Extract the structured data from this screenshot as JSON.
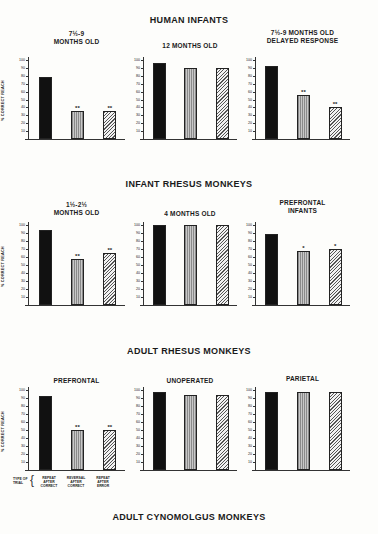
{
  "sections": [
    {
      "title": "HUMAN INFANTS"
    },
    {
      "title": "INFANT RHESUS MONKEYS"
    },
    {
      "title": "ADULT RHESUS MONKEYS"
    },
    {
      "title": "ADULT CYNOMOLGUS MONKEYS"
    }
  ],
  "y_axis_label": "% CORRECT REACH",
  "y_ticks": [
    "10",
    "20",
    "30",
    "40",
    "50",
    "60",
    "70",
    "80",
    "90",
    "100"
  ],
  "trial_type_label": "TYPE OF TRIAL",
  "trial_types": [
    "REPEAT AFTER CORRECT",
    "REVERSAL AFTER CORRECT",
    "REPEAT AFTER ERROR"
  ],
  "chart_data": [
    {
      "type": "bar",
      "section": "HUMAN INFANTS",
      "title": "7½-9 MONTHS OLD",
      "ylabel": "% CORRECT REACH",
      "ylim": [
        0,
        100
      ],
      "categories": [
        "Repeat after correct",
        "Reversal after correct",
        "Repeat after error"
      ],
      "values": [
        79,
        35,
        36
      ],
      "significance": [
        "",
        "**",
        "**"
      ]
    },
    {
      "type": "bar",
      "section": "HUMAN INFANTS",
      "title": "12 MONTHS OLD",
      "ylabel": "",
      "ylim": [
        0,
        100
      ],
      "categories": [
        "Repeat after correct",
        "Reversal after correct",
        "Repeat after error"
      ],
      "values": [
        96,
        90,
        90
      ],
      "significance": [
        "",
        "",
        ""
      ]
    },
    {
      "type": "bar",
      "section": "HUMAN INFANTS",
      "title": "7½-9 MONTHS OLD DELAYED RESPONSE",
      "ylabel": "",
      "ylim": [
        0,
        100
      ],
      "categories": [
        "Repeat after correct",
        "Reversal after correct",
        "Repeat after error"
      ],
      "values": [
        92,
        56,
        40
      ],
      "significance": [
        "",
        "**",
        "**"
      ]
    },
    {
      "type": "bar",
      "section": "INFANT RHESUS MONKEYS",
      "title": "1½-2½ MONTHS OLD",
      "ylabel": "% CORRECT REACH",
      "ylim": [
        0,
        100
      ],
      "categories": [
        "Repeat after correct",
        "Reversal after correct",
        "Repeat after error"
      ],
      "values": [
        94,
        57,
        65
      ],
      "significance": [
        "",
        "**",
        "**"
      ]
    },
    {
      "type": "bar",
      "section": "INFANT RHESUS MONKEYS",
      "title": "4 MONTHS OLD",
      "ylabel": "",
      "ylim": [
        0,
        100
      ],
      "categories": [
        "Repeat after correct",
        "Reversal after correct",
        "Repeat after error"
      ],
      "values": [
        100,
        100,
        100
      ],
      "significance": [
        "",
        "",
        ""
      ]
    },
    {
      "type": "bar",
      "section": "INFANT RHESUS MONKEYS",
      "title": "PREFRONTAL INFANTS",
      "ylabel": "",
      "ylim": [
        0,
        100
      ],
      "categories": [
        "Repeat after correct",
        "Reversal after correct",
        "Repeat after error"
      ],
      "values": [
        89,
        67,
        70
      ],
      "significance": [
        "",
        "*",
        "*"
      ]
    },
    {
      "type": "bar",
      "section": "ADULT RHESUS MONKEYS",
      "title": "PREFRONTAL",
      "ylabel": "% CORRECT REACH",
      "ylim": [
        0,
        100
      ],
      "categories": [
        "Repeat after correct",
        "Reversal after correct",
        "Repeat after error"
      ],
      "values": [
        93,
        50,
        50
      ],
      "significance": [
        "",
        "**",
        "**"
      ]
    },
    {
      "type": "bar",
      "section": "ADULT RHESUS MONKEYS",
      "title": "UNOPERATED",
      "ylabel": "",
      "ylim": [
        0,
        100
      ],
      "categories": [
        "Repeat after correct",
        "Reversal after correct",
        "Repeat after error"
      ],
      "values": [
        97,
        94,
        94
      ],
      "significance": [
        "",
        "",
        ""
      ]
    },
    {
      "type": "bar",
      "section": "ADULT RHESUS MONKEYS",
      "title": "PARIETAL",
      "ylabel": "",
      "ylim": [
        0,
        100
      ],
      "categories": [
        "Repeat after correct",
        "Reversal after correct",
        "Repeat after error"
      ],
      "values": [
        97,
        97,
        97
      ],
      "significance": [
        "",
        "",
        ""
      ]
    }
  ]
}
